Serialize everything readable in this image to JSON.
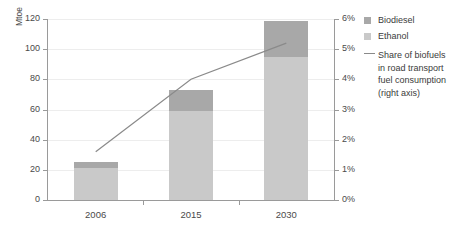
{
  "chart_data": {
    "type": "bar",
    "title": "",
    "categories": [
      "2006",
      "2015",
      "2030"
    ],
    "series": [
      {
        "name": "Ethanol",
        "values": [
          21,
          59,
          95
        ],
        "color": "#c9c9c9"
      },
      {
        "name": "Biodiesel",
        "values": [
          4,
          14,
          24
        ],
        "color": "#a8a8a8"
      },
      {
        "name": "Share of biofuels in road transport fuel consumption (right axis)",
        "values": [
          1.6,
          4.0,
          5.2
        ],
        "axis": "right",
        "type": "line",
        "color": "#8a8a8a"
      }
    ],
    "xlabel": "",
    "ylabel": "Mtoe",
    "ylim": [
      0,
      120
    ],
    "y_ticks": [
      0,
      20,
      40,
      60,
      80,
      100,
      120
    ],
    "y2lim": [
      0,
      6
    ],
    "y2_ticks": [
      "0%",
      "1%",
      "2%",
      "3%",
      "4%",
      "5%",
      "6%"
    ],
    "y2label": "",
    "grid": true,
    "legend_position": "right",
    "stacked": true
  },
  "axes": {
    "left_title": "Mtoe",
    "left_ticks": [
      "0",
      "20",
      "40",
      "60",
      "80",
      "100",
      "120"
    ],
    "right_ticks": [
      "0%",
      "1%",
      "2%",
      "3%",
      "4%",
      "5%",
      "6%"
    ],
    "x_ticks": [
      "2006",
      "2015",
      "2030"
    ]
  },
  "legend": {
    "items": [
      {
        "label": "Biodiesel",
        "type": "swatch"
      },
      {
        "label": "Ethanol",
        "type": "swatch"
      },
      {
        "label": "Share of biofuels\nin road transport\nfuel consumption\n(right axis)",
        "type": "line"
      }
    ],
    "line_note_lines": [
      "Share of biofuels",
      "in road transport",
      "fuel consumption",
      "(right axis)"
    ]
  },
  "colors": {
    "biodiesel": "#a8a8a8",
    "ethanol": "#c9c9c9",
    "line": "#8a8a8a",
    "axis": "#9a9a9a",
    "grid": "#ededed"
  }
}
